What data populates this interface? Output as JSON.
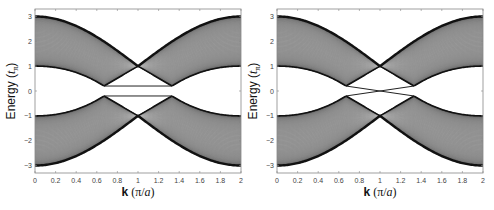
{
  "figure": {
    "panels": [
      {
        "id": "left",
        "variant": "gapped"
      },
      {
        "id": "right",
        "variant": "crossing"
      }
    ]
  },
  "chart_data": [
    {
      "type": "line",
      "title": "",
      "xlabel": "k (π/a)",
      "ylabel": "Energy (tπ)",
      "xlim": [
        0,
        2
      ],
      "ylim": [
        -3.3,
        3.3
      ],
      "xticks": [
        0,
        0.2,
        0.4,
        0.6,
        0.8,
        1,
        1.2,
        1.4,
        1.6,
        1.8,
        2
      ],
      "yticks": [
        -3,
        -2,
        -1,
        0,
        1,
        2,
        3
      ],
      "grid": false,
      "legend": null,
      "description": "Dense bulk band continuum (upper band 1..3, lower band -1..-3) closing to a point at k=1, E=±1; flat edge states at E≈±0.2 between k≈0.67 and k≈1.33",
      "series": [
        {
          "name": "upper band top edge",
          "x": [
            0,
            0.2,
            0.4,
            0.6,
            0.8,
            1,
            1.2,
            1.4,
            1.6,
            1.8,
            2
          ],
          "y": [
            3,
            2.9,
            2.6,
            2.1,
            1.5,
            1,
            1.5,
            2.1,
            2.6,
            2.9,
            3
          ]
        },
        {
          "name": "upper band bottom edge",
          "x": [
            0,
            0.2,
            0.4,
            0.6,
            0.67,
            0.8,
            1,
            1.2,
            1.33,
            1.4,
            1.6,
            1.8,
            2
          ],
          "y": [
            1,
            0.95,
            0.8,
            0.45,
            0.2,
            0.55,
            1,
            0.55,
            0.2,
            0.45,
            0.8,
            0.95,
            1
          ]
        },
        {
          "name": "edge state (upper)",
          "x": [
            0.67,
            1.33
          ],
          "y": [
            0.2,
            0.2
          ]
        },
        {
          "name": "edge state (lower)",
          "x": [
            0.67,
            1.33
          ],
          "y": [
            -0.2,
            -0.2
          ]
        },
        {
          "name": "lower band top edge",
          "x": [
            0,
            0.2,
            0.4,
            0.6,
            0.67,
            0.8,
            1,
            1.2,
            1.33,
            1.4,
            1.6,
            1.8,
            2
          ],
          "y": [
            -1,
            -0.95,
            -0.8,
            -0.45,
            -0.2,
            -0.55,
            -1,
            -0.55,
            -0.2,
            -0.45,
            -0.8,
            -0.95,
            -1
          ]
        },
        {
          "name": "lower band bottom edge",
          "x": [
            0,
            0.2,
            0.4,
            0.6,
            0.8,
            1,
            1.2,
            1.4,
            1.6,
            1.8,
            2
          ],
          "y": [
            -3,
            -2.9,
            -2.6,
            -2.1,
            -1.5,
            -1,
            -1.5,
            -2.1,
            -2.6,
            -2.9,
            -3
          ]
        }
      ]
    },
    {
      "type": "line",
      "title": "",
      "xlabel": "k (π/a)",
      "ylabel": "Energy (tπ)",
      "xlim": [
        0,
        2
      ],
      "ylim": [
        -3.3,
        3.3
      ],
      "xticks": [
        0,
        0.2,
        0.4,
        0.6,
        0.8,
        1,
        1.2,
        1.4,
        1.6,
        1.8,
        2
      ],
      "yticks": [
        -3,
        -2,
        -1,
        0,
        1,
        2,
        3
      ],
      "grid": false,
      "legend": null,
      "description": "Same bulk bands; edge states cross linearly at k=1, E=0 (from ±0.2 at k≈0.67 to ∓0.2 at k≈1.33)",
      "series": [
        {
          "name": "upper band top edge",
          "x": [
            0,
            0.2,
            0.4,
            0.6,
            0.8,
            1,
            1.2,
            1.4,
            1.6,
            1.8,
            2
          ],
          "y": [
            3,
            2.9,
            2.6,
            2.1,
            1.5,
            1,
            1.5,
            2.1,
            2.6,
            2.9,
            3
          ]
        },
        {
          "name": "upper band bottom edge",
          "x": [
            0,
            0.2,
            0.4,
            0.6,
            0.67,
            0.8,
            1,
            1.2,
            1.33,
            1.4,
            1.6,
            1.8,
            2
          ],
          "y": [
            1,
            0.95,
            0.8,
            0.45,
            0.2,
            0.55,
            1,
            0.55,
            0.2,
            0.45,
            0.8,
            0.95,
            1
          ]
        },
        {
          "name": "edge state A",
          "x": [
            0.67,
            1,
            1.33
          ],
          "y": [
            0.2,
            0,
            -0.2
          ]
        },
        {
          "name": "edge state B",
          "x": [
            0.67,
            1,
            1.33
          ],
          "y": [
            -0.2,
            0,
            0.2
          ]
        },
        {
          "name": "lower band top edge",
          "x": [
            0,
            0.2,
            0.4,
            0.6,
            0.67,
            0.8,
            1,
            1.2,
            1.33,
            1.4,
            1.6,
            1.8,
            2
          ],
          "y": [
            -1,
            -0.95,
            -0.8,
            -0.45,
            -0.2,
            -0.55,
            -1,
            -0.55,
            -0.2,
            -0.45,
            -0.8,
            -0.95,
            -1
          ]
        },
        {
          "name": "lower band bottom edge",
          "x": [
            0,
            0.2,
            0.4,
            0.6,
            0.8,
            1,
            1.2,
            1.4,
            1.6,
            1.8,
            2
          ],
          "y": [
            -3,
            -2.9,
            -2.6,
            -2.1,
            -1.5,
            -1,
            -1.5,
            -2.1,
            -2.6,
            -2.9,
            -3
          ]
        }
      ]
    }
  ],
  "labels": {
    "xlabel_bold": "k",
    "xlabel_rest_open": " (π/",
    "xlabel_ital": "a",
    "xlabel_close": ")",
    "ylabel_main": "Energy (",
    "ylabel_ital": "t",
    "ylabel_sub": "π",
    "ylabel_close": ")"
  },
  "colors": {
    "band_dark": "#111111",
    "band_mid": "#8a8a8a",
    "band_light": "#c8c8c8",
    "axis": "#888888",
    "edge_state": "#222222"
  }
}
